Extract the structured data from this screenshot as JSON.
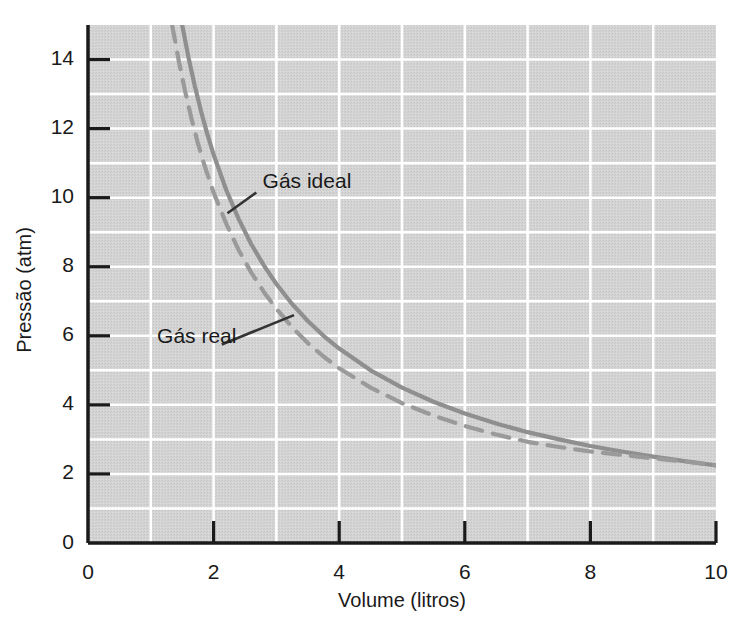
{
  "chart_data": {
    "type": "line",
    "title": "",
    "xlabel": "Volume (litros)",
    "ylabel": "Pressão (atm)",
    "xlim": [
      0,
      10
    ],
    "ylim": [
      0,
      15
    ],
    "xticks": [
      0,
      2,
      4,
      6,
      8,
      10
    ],
    "yticks": [
      0,
      2,
      4,
      6,
      8,
      10,
      12,
      14
    ],
    "xtick_labels": [
      "0",
      "2",
      "4",
      "6",
      "8",
      "10"
    ],
    "ytick_labels": [
      "0",
      "2",
      "4",
      "6",
      "8",
      "10",
      "12",
      "14"
    ],
    "grid": true,
    "grid_minor_step_x": 1,
    "grid_minor_step_y": 1,
    "legend_position": "inline-annotations",
    "series": [
      {
        "name": "Gás ideal",
        "style": "solid",
        "color": "#8f8f8f",
        "annotation": "Gás ideal",
        "x": [
          1.5,
          1.6,
          1.7,
          1.8,
          1.9,
          2.0,
          2.2,
          2.4,
          2.6,
          2.8,
          3.0,
          3.25,
          3.5,
          3.75,
          4.0,
          4.5,
          5.0,
          5.5,
          6.0,
          6.5,
          7.0,
          7.5,
          8.0,
          8.5,
          9.0,
          9.5,
          10.0
        ],
        "y": [
          15.0,
          14.06,
          13.24,
          12.5,
          11.84,
          11.25,
          10.23,
          9.38,
          8.65,
          8.04,
          7.5,
          6.92,
          6.43,
          6.0,
          5.63,
          5.0,
          4.5,
          4.09,
          3.75,
          3.46,
          3.21,
          3.0,
          2.81,
          2.65,
          2.5,
          2.37,
          2.25
        ]
      },
      {
        "name": "Gás real",
        "style": "dashed",
        "color": "#9a9a9a",
        "annotation": "Gás real",
        "x": [
          1.34,
          1.45,
          1.55,
          1.65,
          1.75,
          1.85,
          2.0,
          2.2,
          2.4,
          2.6,
          2.8,
          3.0,
          3.25,
          3.5,
          3.75,
          4.0,
          4.5,
          5.0,
          5.5,
          6.0,
          6.5,
          7.0,
          7.5,
          8.0,
          8.5,
          9.0,
          9.5,
          10.0
        ],
        "y": [
          15.0,
          13.92,
          13.05,
          12.27,
          11.58,
          10.96,
          10.15,
          9.25,
          8.48,
          7.83,
          7.27,
          6.78,
          6.25,
          5.79,
          5.4,
          5.06,
          4.5,
          4.05,
          3.69,
          3.39,
          3.14,
          2.93,
          2.78,
          2.65,
          2.55,
          2.45,
          2.36,
          2.25
        ]
      }
    ],
    "annotations": [
      {
        "text": "Gás ideal",
        "text_x": 2.78,
        "text_y": 10.45,
        "leader_from_x": 2.68,
        "leader_from_y": 10.15,
        "leader_to_x": 2.22,
        "leader_to_y": 9.55
      },
      {
        "text": "Gás real",
        "text_x": 1.1,
        "text_y": 5.95,
        "leader_from_x": 2.13,
        "leader_from_y": 5.75,
        "leader_to_x": 3.28,
        "leader_to_y": 6.6
      }
    ],
    "colors": {
      "plot_background": "#d2d2d2",
      "grid_line": "#ffffff",
      "axis_line": "#1a1a1a",
      "text": "#1a1a1a",
      "ideal_curve": "#8f8f8f",
      "real_curve": "#9a9a9a",
      "leader_line": "#333333"
    }
  }
}
